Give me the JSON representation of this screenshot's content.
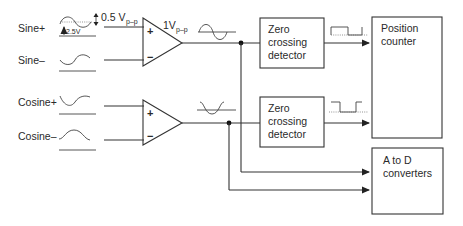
{
  "diagram": {
    "inputs": {
      "sine_plus": "Sine+",
      "sine_minus": "Sine–",
      "cosine_plus": "Cosine+",
      "cosine_minus": "Cosine–"
    },
    "annotations": {
      "offset": "2.5V",
      "input_amp_main": "0.5 V",
      "input_amp_sub": "p–p",
      "output_amp_main": "1V",
      "output_amp_sub": "p–p"
    },
    "amplifiers": [
      {
        "plus": "+",
        "minus": "−"
      },
      {
        "plus": "+",
        "minus": "−"
      }
    ],
    "blocks": {
      "zcd1": [
        "Zero",
        "crossing",
        "detector"
      ],
      "zcd2": [
        "Zero",
        "crossing",
        "detector"
      ],
      "position_counter": [
        "Position",
        "counter"
      ],
      "adc": [
        "A to D",
        "converters"
      ]
    }
  }
}
